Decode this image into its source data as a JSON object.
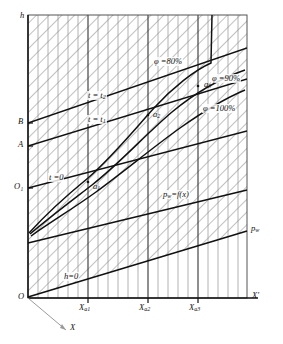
{
  "figure": {
    "kind": "engineering-diagram"
  },
  "axes": {
    "y_label": "h",
    "x_label_right": "X'",
    "x_label_oblique": "X",
    "origin_label": "O",
    "secondary_origin_label": "O₁",
    "right_axis_label": "pᵥᵥ",
    "left_marks": [
      {
        "id": "B",
        "label": "B",
        "y": 123
      },
      {
        "id": "A",
        "label": "A",
        "y": 146
      },
      {
        "id": "O1",
        "label": "O₁",
        "y": 188
      }
    ],
    "x_ticks": [
      {
        "label": "X",
        "sub": "a1",
        "x": 88
      },
      {
        "label": "X",
        "sub": "a2",
        "x": 148
      },
      {
        "label": "X",
        "sub": "a3",
        "x": 198
      }
    ]
  },
  "curves": {
    "humidity": [
      {
        "id": "phi80",
        "label": "φ =80%",
        "value": 80
      },
      {
        "id": "phi90",
        "label": "φ =90%",
        "value": 90
      },
      {
        "id": "phi100",
        "label": "φ =100%",
        "value": 100
      }
    ],
    "isotherms": [
      {
        "id": "t2",
        "label": "t = t",
        "sub": "2"
      },
      {
        "id": "t1",
        "label": "t = t",
        "sub": "1"
      },
      {
        "id": "t0",
        "label": "t =0",
        "sub": ""
      }
    ],
    "baseline": {
      "id": "h0",
      "label": "h=0"
    },
    "pressure": {
      "id": "pw",
      "label": "p",
      "sub": "w",
      "rest": "=f(x)"
    }
  },
  "points": [
    {
      "id": "a1",
      "label": "a",
      "sub": "1",
      "x": 90,
      "y": 186
    },
    {
      "id": "a2",
      "label": "a",
      "sub": "2",
      "x": 152,
      "y": 117
    },
    {
      "id": "a3",
      "label": "a",
      "sub": "3",
      "x": 208,
      "y": 88
    }
  ],
  "style": {
    "line_color": "#111111",
    "grid_color": "#9a9a9a",
    "hatch_color": "#8c8c8c",
    "background": "#ffffff"
  }
}
